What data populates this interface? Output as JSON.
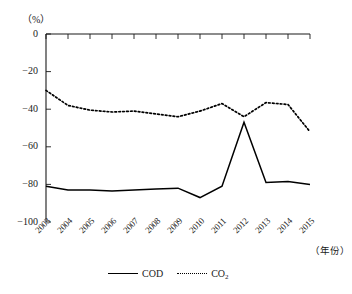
{
  "chart_data": {
    "type": "line",
    "title": "",
    "subtitle": "",
    "xlabel": "(年份)",
    "ylabel": "(%)",
    "ylim": [
      -100,
      0
    ],
    "yticks": [
      0,
      -20,
      -40,
      -60,
      -80,
      -100
    ],
    "ytick_labels": [
      "0",
      "−20",
      "−40",
      "−60",
      "−80",
      "−100"
    ],
    "grid": false,
    "legend_position": "bottom",
    "categories": [
      "2003",
      "2004",
      "2005",
      "2006",
      "2007",
      "2008",
      "2009",
      "2010",
      "2011",
      "2012",
      "2013",
      "2014",
      "2015"
    ],
    "series": [
      {
        "name": "COD",
        "style": "solid",
        "color": "#000000",
        "values": [
          -81,
          -83,
          -83,
          -83.5,
          -83,
          -82.5,
          -82,
          -87,
          -81,
          -47,
          -79,
          -78.5,
          -80
        ]
      },
      {
        "name": "CO2",
        "name_display": "CO",
        "name_subscript": "2",
        "style": "dotted",
        "color": "#000000",
        "values": [
          -30,
          -38,
          -40.5,
          -41.5,
          -41,
          -42.5,
          -44,
          -41,
          -37,
          -44,
          -36.5,
          -37.5,
          -52
        ]
      }
    ]
  },
  "axes": {
    "unit_label": "（%）",
    "x_axis_title": "（年份）"
  },
  "legend": {
    "items": [
      {
        "label": "COD",
        "style": "solid"
      },
      {
        "label": "CO",
        "subscript": "2",
        "style": "dotted"
      }
    ]
  }
}
